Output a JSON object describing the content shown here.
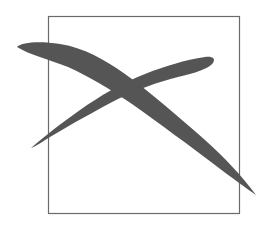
{
  "figure": {
    "box": {
      "x": 48,
      "y": 16,
      "width": 192,
      "height": 198,
      "stroke": "#6a6a6a"
    },
    "cross": {
      "color": "#555555",
      "stroke_a": {
        "from": [
          17,
          47
        ],
        "to": [
          256,
          195
        ]
      },
      "stroke_b": {
        "from": [
          31,
          148
        ],
        "to": [
          214,
          58
        ]
      }
    }
  }
}
